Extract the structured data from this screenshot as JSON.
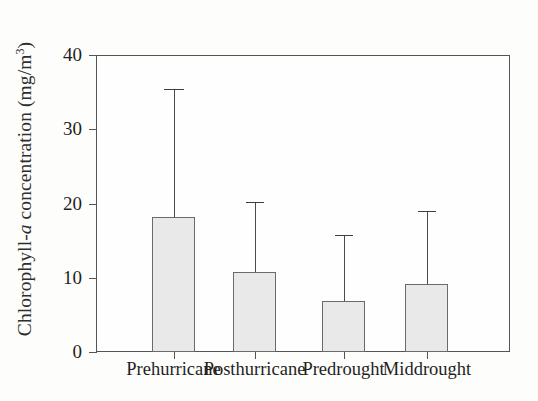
{
  "figure": {
    "background_color": "#fdfdfc",
    "frame_color": "#555453",
    "bar_fill_color": "#e9e9e9",
    "bar_edge_color": "#6a6a6a",
    "error_bar_color": "#3d3d3d"
  },
  "axis": {
    "y_title_prefix": "Chlorophyll-",
    "y_title_italic": "a",
    "y_title_mid": " concentration (mg/m",
    "y_title_sup": "3",
    "y_title_suffix": ")",
    "y_ticks": [
      "0",
      "10",
      "20",
      "30",
      "40"
    ]
  },
  "chart_data": {
    "type": "bar",
    "title": "",
    "subtitle": "",
    "xlabel": "",
    "ylabel": "Chlorophyll-a concentration (mg/m3)",
    "categories": [
      "Prehurricane",
      "Posthurricane",
      "Predrought",
      "Middrought"
    ],
    "values": [
      18.2,
      10.8,
      6.9,
      9.2
    ],
    "error_upper": [
      35.4,
      20.2,
      15.8,
      19.0
    ],
    "error_lower": [
      18.2,
      10.8,
      6.9,
      9.2
    ],
    "error_type": "upper-only standard deviation whisker",
    "ylim": [
      0,
      40
    ],
    "yticks": [
      0,
      10,
      20,
      30,
      40
    ],
    "grid": false,
    "legend": "none",
    "legend_position": "none",
    "annotations": []
  }
}
